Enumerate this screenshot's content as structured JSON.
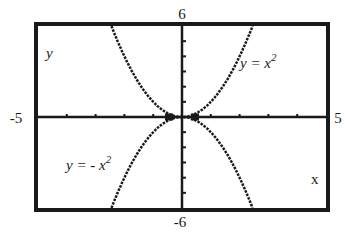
{
  "chart_data": {
    "type": "line",
    "title": "",
    "xlabel": "x",
    "ylabel": "y",
    "xlim": [
      -5,
      5
    ],
    "ylim": [
      -6,
      6
    ],
    "x_tick_step": 1,
    "y_tick_step": 1,
    "axis_end_labels": {
      "xmin": "-5",
      "xmax": "5",
      "ymin": "-6",
      "ymax": "6"
    },
    "grid": false,
    "series": [
      {
        "name": "y = x^2",
        "label": "y = x",
        "exponent_label": "2",
        "equation": "y = x^2",
        "sign": 1,
        "x": [
          -2.4,
          -2,
          -1.5,
          -1,
          -0.5,
          0,
          0.5,
          1,
          1.5,
          2,
          2.4
        ],
        "y": [
          5.76,
          4,
          2.25,
          1,
          0.25,
          0,
          0.25,
          1,
          2.25,
          4,
          5.76
        ]
      },
      {
        "name": "y = -x^2",
        "label": "y = - x",
        "exponent_label": "2",
        "equation": "y = -x^2",
        "sign": -1,
        "x": [
          -2.4,
          -2,
          -1.5,
          -1,
          -0.5,
          0,
          0.5,
          1,
          1.5,
          2,
          2.4
        ],
        "y": [
          -5.76,
          -4,
          -2.25,
          -1,
          -0.25,
          0,
          -0.25,
          -1,
          -2.25,
          -4,
          -5.76
        ]
      }
    ],
    "colors": {
      "ink": "#1a1a1a",
      "background": "#ffffff"
    }
  }
}
